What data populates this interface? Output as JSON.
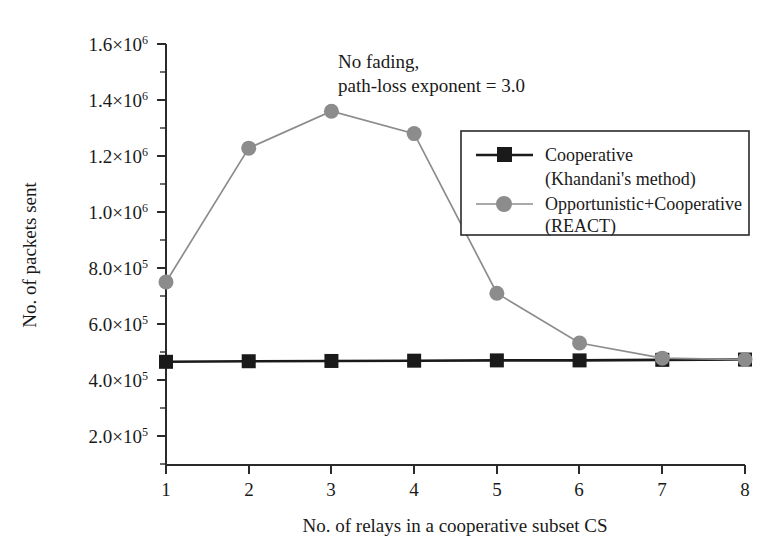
{
  "chart_data": {
    "type": "line",
    "title": "",
    "xlabel": "No. of relays in a cooperative subset CS",
    "ylabel": "No. of packets sent",
    "x": [
      1,
      2,
      3,
      4,
      5,
      6,
      7,
      8
    ],
    "xticklabels": [
      "1",
      "2",
      "3",
      "4",
      "5",
      "6",
      "7",
      "8"
    ],
    "xlim": [
      0.7,
      8.3
    ],
    "ylim": [
      100000,
      1600000
    ],
    "yticks": [
      200000,
      400000,
      600000,
      800000,
      1000000,
      1200000,
      1400000,
      1600000
    ],
    "yticklabels": [
      {
        "mantissa": "2.0×10",
        "exponent": "5"
      },
      {
        "mantissa": "4.0×10",
        "exponent": "5"
      },
      {
        "mantissa": "6.0×10",
        "exponent": "5"
      },
      {
        "mantissa": "8.0×10",
        "exponent": "5"
      },
      {
        "mantissa": "1.0×10",
        "exponent": "6"
      },
      {
        "mantissa": "1.2×10",
        "exponent": "6"
      },
      {
        "mantissa": "1.4×10",
        "exponent": "6"
      },
      {
        "mantissa": "1.6×10",
        "exponent": "6"
      }
    ],
    "grid": false,
    "legend_position": "upper right",
    "series": [
      {
        "name": "Cooperative\n(Khandani's method)",
        "label_line1": "Cooperative",
        "label_line2": "(Khandani's method)",
        "marker": "square",
        "color": "#1a1a1a",
        "values": [
          465000,
          467000,
          468000,
          469000,
          470000,
          470000,
          472000,
          473000
        ]
      },
      {
        "name": "Opportunistic+Cooperative\n(REACT)",
        "label_line1": "Opportunistic+Cooperative",
        "label_line2": "(REACT)",
        "marker": "circle",
        "color": "#8c8c8c",
        "values": [
          750000,
          1228000,
          1360000,
          1280000,
          710000,
          532000,
          478000,
          473000
        ]
      }
    ],
    "annotations": [
      {
        "line1": "No fading,",
        "line2": "path-loss exponent = 3.0"
      }
    ]
  },
  "colors": {
    "axis": "#2a2a2a",
    "series_black": "#1a1a1a",
    "series_gray": "#8c8c8c",
    "background": "#ffffff"
  }
}
